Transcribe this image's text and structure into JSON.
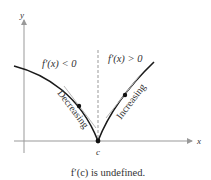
{
  "diagram": {
    "axes": {
      "x_label": "x",
      "y_label": "y"
    },
    "point_label": "c",
    "left_region_label": "f′(x) < 0",
    "right_region_label": "f′(x) > 0",
    "left_curve_label": "Decreasing",
    "right_curve_label": "Increasing",
    "caption": "f′(c) is undefined.",
    "colors": {
      "curve": "#1a1a1a",
      "axis": "#999999",
      "dashed": "#999999",
      "text": "#333333"
    }
  }
}
